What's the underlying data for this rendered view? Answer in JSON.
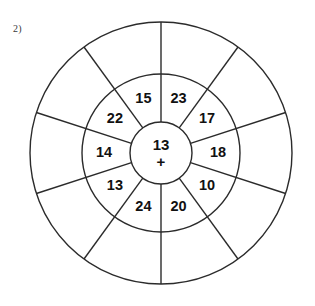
{
  "page": {
    "question_label": "2)",
    "background_color": "#ffffff",
    "line_color": "#2b2b2b",
    "text_color": "#111111"
  },
  "puzzle": {
    "type": "addition-circle-wheel",
    "center": {
      "number": "13",
      "operator": "+"
    },
    "geometry": {
      "cx": 161,
      "cy": 153,
      "r_inner": 31,
      "r_middle": 79,
      "r_outer": 131,
      "sector_count": 10,
      "start_angle_deg": -90
    },
    "middle_ring": [
      {
        "index": 0,
        "label": "23",
        "angle_deg": -72
      },
      {
        "index": 1,
        "label": "17",
        "angle_deg": -36
      },
      {
        "index": 2,
        "label": "18",
        "angle_deg": 0
      },
      {
        "index": 3,
        "label": "10",
        "angle_deg": 36
      },
      {
        "index": 4,
        "label": "20",
        "angle_deg": 72
      },
      {
        "index": 5,
        "label": "24",
        "angle_deg": 108
      },
      {
        "index": 6,
        "label": "13",
        "angle_deg": 144
      },
      {
        "index": 7,
        "label": "14",
        "angle_deg": 180
      },
      {
        "index": 8,
        "label": "22",
        "angle_deg": 216
      },
      {
        "index": 9,
        "label": "15",
        "angle_deg": 252
      }
    ],
    "outer_ring": [
      {
        "index": 0,
        "label": ""
      },
      {
        "index": 1,
        "label": ""
      },
      {
        "index": 2,
        "label": ""
      },
      {
        "index": 3,
        "label": ""
      },
      {
        "index": 4,
        "label": ""
      },
      {
        "index": 5,
        "label": ""
      },
      {
        "index": 6,
        "label": ""
      },
      {
        "index": 7,
        "label": ""
      },
      {
        "index": 8,
        "label": ""
      },
      {
        "index": 9,
        "label": ""
      }
    ]
  }
}
